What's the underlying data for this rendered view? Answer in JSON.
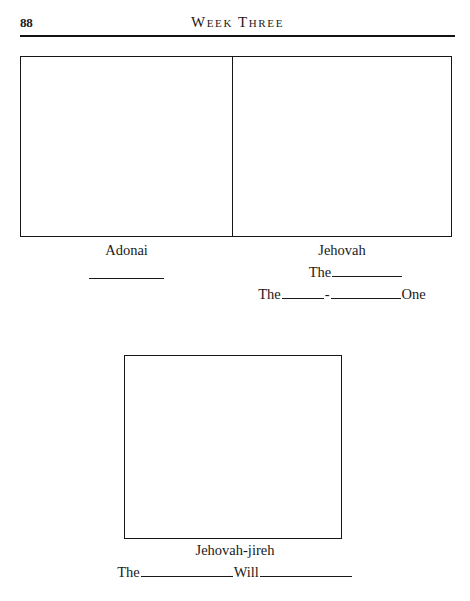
{
  "page": {
    "folio": "88",
    "running_title": "Week Three",
    "background_color": "#ffffff",
    "ink_color": "#1a1a1a"
  },
  "figures": [
    {
      "name": "adonai-box",
      "caption_title": "Adonai",
      "caption_lines": [
        ""
      ]
    },
    {
      "name": "jehovah-box",
      "caption_title": "Jehovah",
      "caption_lines": [
        "The",
        "The",
        "One"
      ]
    },
    {
      "name": "jehovah-jireh-box",
      "caption_title": "Jehovah-jireh",
      "caption_lines": [
        "The",
        "Will"
      ]
    }
  ],
  "captions": {
    "adonai": {
      "title": "Adonai"
    },
    "jehovah": {
      "title": "Jehovah",
      "line1_the": "The",
      "line2_the": "The",
      "line2_hyphen": "-",
      "line2_one": "One"
    },
    "jehovah_jireh": {
      "title": "Jehovah-jireh",
      "line_the": "The",
      "line_will": "Will"
    }
  }
}
